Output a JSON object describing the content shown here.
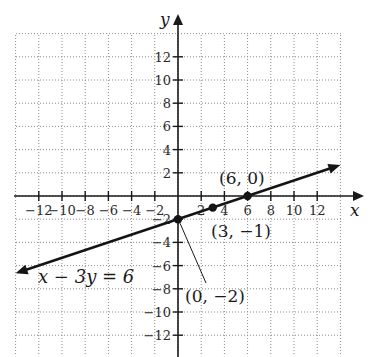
{
  "chart_data": {
    "type": "line",
    "title": "",
    "xlabel": "x",
    "ylabel": "y",
    "xlim": [
      -14,
      14
    ],
    "ylim": [
      -14,
      14
    ],
    "grid": true,
    "grid_step": 2,
    "x_ticks": [
      -12,
      -10,
      -8,
      -6,
      -4,
      -2,
      2,
      4,
      6,
      8,
      10,
      12
    ],
    "y_ticks": [
      12,
      10,
      8,
      6,
      4,
      2,
      -2,
      -4,
      -6,
      -8,
      -10,
      -12
    ],
    "x_tick_labels": [
      "−12",
      "−10",
      "−8",
      "−6",
      "−4",
      "−2",
      "2",
      "4",
      "6",
      "8",
      "10",
      "12"
    ],
    "y_tick_labels": [
      "12",
      "10",
      "8",
      "6",
      "4",
      "2",
      "−2",
      "−4",
      "−6",
      "−8",
      "−10",
      "−12"
    ],
    "series": [
      {
        "name": "x − 3y = 6",
        "equation": "x - 3y = 6",
        "slope": 0.3333,
        "intercept": -2,
        "x": [
          -14,
          14
        ],
        "y": [
          -6.667,
          2.667
        ],
        "arrows": "both"
      }
    ],
    "points": [
      {
        "x": 6,
        "y": 0,
        "label": "(6, 0)"
      },
      {
        "x": 3,
        "y": -1,
        "label": "(3, −1)"
      },
      {
        "x": 0,
        "y": -2,
        "label": "(0, −2)"
      }
    ],
    "annotations": [
      {
        "text": "x − 3y = 6",
        "near": "lower-left line end"
      }
    ]
  },
  "labels": {
    "x_axis": "x",
    "y_axis": "y",
    "equation": "x − 3y = 6",
    "point_6_0": "(6, 0)",
    "point_3_m1": "(3, −1)",
    "point_0_m2": "(0, −2)"
  },
  "colors": {
    "line": "#141414",
    "grid": "#8a8a8a",
    "axis": "#1a1a1a",
    "background": "#ffffff"
  }
}
